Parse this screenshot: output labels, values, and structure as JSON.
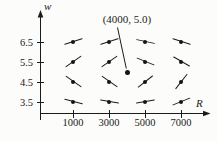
{
  "figure": {
    "background": "#fcfcfa",
    "ink": "#1b1b1b"
  },
  "chart_data": {
    "type": "scatter",
    "subtype": "direction-field",
    "title": "",
    "xlabel": "R",
    "ylabel": "w",
    "x_ticks": [
      "1000",
      "3000",
      "5000",
      "7000"
    ],
    "y_ticks": [
      "6.5",
      "5.5",
      "4.5",
      "3.5"
    ],
    "xlim": [
      0,
      8400
    ],
    "ylim": [
      2.9,
      7.4
    ],
    "grid": false,
    "annotation": {
      "label": "(4000, 5.0)",
      "target": {
        "R": 4000,
        "w": 5.0
      }
    },
    "equilibrium_point": {
      "R": 4000,
      "w": 5.0
    },
    "field": [
      {
        "R": 1000,
        "w": 6.5,
        "angle_deg": 18
      },
      {
        "R": 3000,
        "w": 6.5,
        "angle_deg": 18
      },
      {
        "R": 5000,
        "w": 6.5,
        "angle_deg": -12
      },
      {
        "R": 7000,
        "w": 6.5,
        "angle_deg": -18
      },
      {
        "R": 1000,
        "w": 5.5,
        "angle_deg": 35
      },
      {
        "R": 3000,
        "w": 5.5,
        "angle_deg": 35
      },
      {
        "R": 5000,
        "w": 5.5,
        "angle_deg": -22
      },
      {
        "R": 7000,
        "w": 5.5,
        "angle_deg": -30
      },
      {
        "R": 1000,
        "w": 4.5,
        "angle_deg": -35
      },
      {
        "R": 3000,
        "w": 4.5,
        "angle_deg": -35
      },
      {
        "R": 5000,
        "w": 4.5,
        "angle_deg": 38
      },
      {
        "R": 7000,
        "w": 4.5,
        "angle_deg": 52
      },
      {
        "R": 1000,
        "w": 3.5,
        "angle_deg": -15
      },
      {
        "R": 3000,
        "w": 3.5,
        "angle_deg": -10
      },
      {
        "R": 5000,
        "w": 3.5,
        "angle_deg": 10
      },
      {
        "R": 7000,
        "w": 3.5,
        "angle_deg": 22
      }
    ]
  }
}
